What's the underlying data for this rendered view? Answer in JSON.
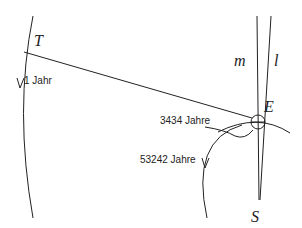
{
  "diagram": {
    "points": {
      "T": "T",
      "E": "E",
      "S": "S"
    },
    "lines": {
      "m": "m",
      "l": "l"
    },
    "labels": {
      "earth_orbit_period": "1 Jahr",
      "period_small_loop": "3434 Jahre",
      "period_large_arc": "53242 Jahre"
    },
    "colors": {
      "stroke": "#222222",
      "background": "#ffffff"
    }
  }
}
